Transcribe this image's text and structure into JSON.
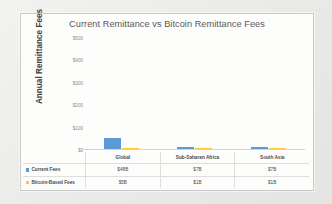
{
  "chart_data": {
    "type": "bar",
    "title": "Current Remittance vs Bitcoin Remittance Fees",
    "xlabel": "",
    "ylabel": "Annual Remittance Fees",
    "categories": [
      "Global",
      "Sub-Saharan Africa",
      "South Asia"
    ],
    "series": [
      {
        "name": "Current Fees",
        "color": "#5b9bd5",
        "values": [
          48,
          7,
          7
        ],
        "labels": [
          "$48B",
          "$7B",
          "$7B"
        ]
      },
      {
        "name": "Bitcoin-Based Fees",
        "color": "#ffc732",
        "values": [
          5,
          1,
          1
        ],
        "labels": [
          "$5B",
          "$1B",
          "$1B"
        ]
      }
    ],
    "ylim": [
      0,
      500
    ],
    "y_ticks": [
      500,
      400,
      300,
      200,
      100,
      0
    ],
    "y_tick_labels": [
      "$500",
      "$400",
      "$300",
      "$200",
      "$100",
      "$0"
    ],
    "grid": false,
    "legend_position": "data-table",
    "data_table_visible": true
  },
  "table": {
    "row_header_blank": "",
    "rows": [
      {
        "label": "Current Fees",
        "marker": "blue-square-marker"
      },
      {
        "label": "Bitcoin-Based Fees",
        "marker": "yellow-square-marker"
      }
    ]
  }
}
